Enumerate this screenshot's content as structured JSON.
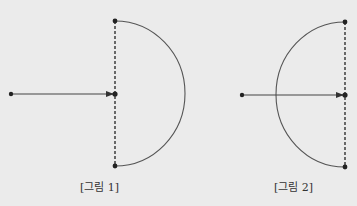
{
  "background": "#ebebeb",
  "ink": "#333333",
  "figures": [
    {
      "id": "fig1",
      "caption": "[그림 1]",
      "caption_x": 80,
      "source_point": [
        11,
        94
      ],
      "arrow_end": [
        112,
        94
      ],
      "dashed_line": {
        "x": 115,
        "y_top": 21,
        "y_mid": 94,
        "y_bottom": 166
      },
      "arc": {
        "orientation": "right",
        "center": [
          115,
          94
        ],
        "radius_x": 70,
        "radius_y": 72.5
      }
    },
    {
      "id": "fig2",
      "caption": "[그림 2]",
      "caption_x": 274,
      "source_point": [
        242,
        95
      ],
      "arrow_end": [
        342,
        95
      ],
      "dashed_line": {
        "x": 345,
        "y_top": 22,
        "y_mid": 95,
        "y_bottom": 167
      },
      "arc": {
        "orientation": "left",
        "center": [
          345,
          95
        ],
        "radius_x": 69,
        "radius_y": 72.5
      }
    }
  ]
}
